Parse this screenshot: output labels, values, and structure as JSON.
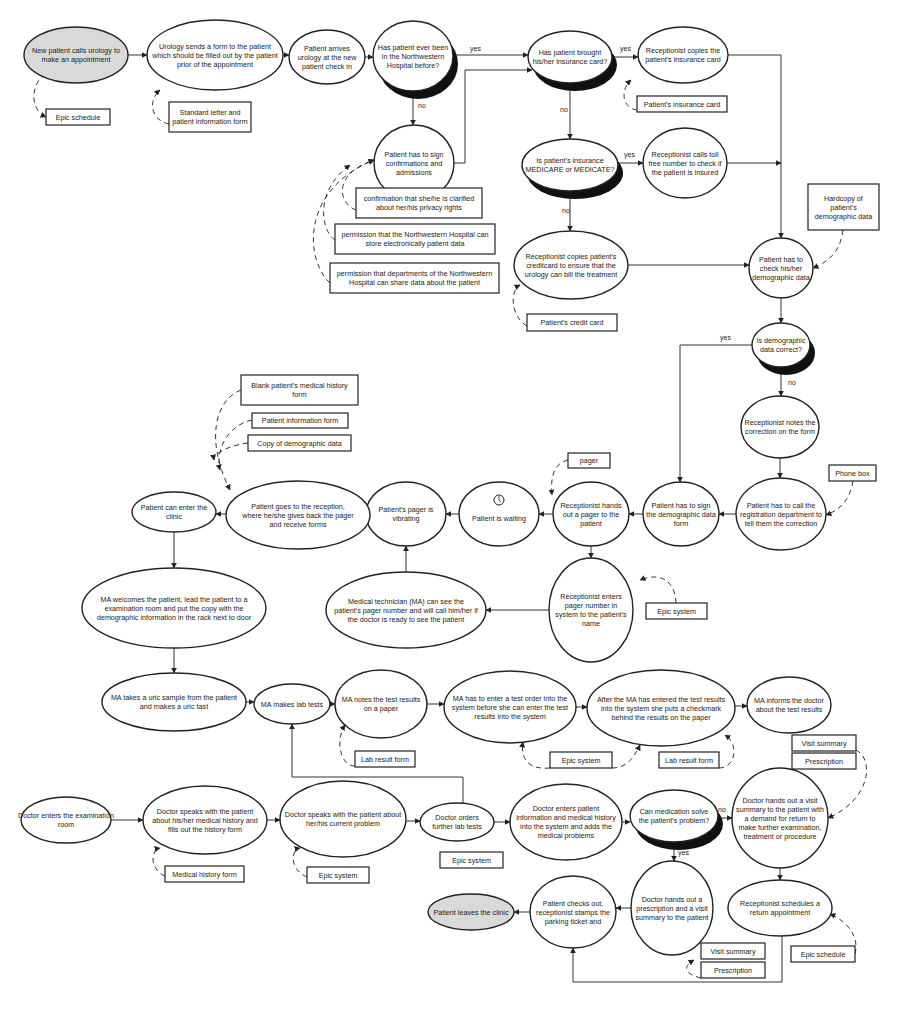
{
  "diagram": {
    "nodes": [
      {
        "id": "n1",
        "type": "start",
        "cx": 76,
        "cy": 55,
        "rx": 52,
        "ry": 28,
        "lines": [
          "New patient calls urology to",
          "make an appointment"
        ]
      },
      {
        "id": "n2",
        "type": "process",
        "cx": 215,
        "cy": 55,
        "rx": 68,
        "ry": 35,
        "lines": [
          "Urology sends a form to the patient",
          "which should be filled out by the patient",
          "prior of the appointment"
        ]
      },
      {
        "id": "n3",
        "type": "process",
        "cx": 327,
        "cy": 57,
        "rx": 38,
        "ry": 27,
        "lines": [
          "Patient arrives",
          "urology at the new",
          "patient check in"
        ]
      },
      {
        "id": "n4",
        "type": "decision",
        "cx": 413,
        "cy": 56,
        "rx": 40,
        "ry": 35,
        "lines": [
          "Has patient ever been",
          "in the Northwestern",
          "Hospital before?"
        ]
      },
      {
        "id": "n5",
        "type": "decision",
        "cx": 570,
        "cy": 57,
        "rx": 42,
        "ry": 26,
        "lines": [
          "Has patient brought",
          "his/her insurance card?"
        ]
      },
      {
        "id": "n6",
        "type": "process",
        "cx": 683,
        "cy": 55,
        "rx": 45,
        "ry": 28,
        "lines": [
          "Receptionist copies the",
          "patient's insurance card"
        ]
      },
      {
        "id": "n7",
        "type": "process",
        "cx": 414,
        "cy": 163,
        "rx": 40,
        "ry": 38,
        "lines": [
          "Patient has to sign",
          "confirmations and",
          "admissions"
        ]
      },
      {
        "id": "n8",
        "type": "decision",
        "cx": 570,
        "cy": 165,
        "rx": 48,
        "ry": 26,
        "lines": [
          "Is patient's insurance",
          "MEDICARE or MEDICATE?"
        ]
      },
      {
        "id": "n9",
        "type": "process",
        "cx": 685,
        "cy": 163,
        "rx": 42,
        "ry": 35,
        "lines": [
          "Receptionist calls toll",
          "free number to check if",
          "the patient is insured"
        ]
      },
      {
        "id": "n10",
        "type": "process",
        "cx": 571,
        "cy": 265,
        "rx": 57,
        "ry": 34,
        "lines": [
          "Receptionist copies patient's",
          "creditcard to ensure that the",
          "urology can bill the treatment"
        ]
      },
      {
        "id": "n11",
        "type": "process",
        "cx": 781,
        "cy": 268,
        "rx": 32,
        "ry": 30,
        "lines": [
          "Patient has to",
          "check his/her",
          "demographic data"
        ]
      },
      {
        "id": "n12",
        "type": "decision",
        "cx": 781,
        "cy": 345,
        "rx": 29,
        "ry": 22,
        "lines": [
          "Is demographic",
          "data correct?"
        ]
      },
      {
        "id": "n13",
        "type": "process",
        "cx": 780,
        "cy": 427,
        "rx": 39,
        "ry": 31,
        "lines": [
          "Receptionist notes the",
          "correction on the form"
        ]
      },
      {
        "id": "n14",
        "type": "process",
        "cx": 781,
        "cy": 514,
        "rx": 45,
        "ry": 36,
        "lines": [
          "Patient has to call the",
          "registration department to",
          "tell them the correction"
        ]
      },
      {
        "id": "n15",
        "type": "process",
        "cx": 681,
        "cy": 514,
        "rx": 38,
        "ry": 32,
        "lines": [
          "Patient has to sign",
          "the demographic data",
          "form"
        ]
      },
      {
        "id": "n16",
        "type": "process",
        "cx": 591,
        "cy": 514,
        "rx": 38,
        "ry": 32,
        "lines": [
          "Receptionist hands",
          "out a pager to the",
          "patient"
        ]
      },
      {
        "id": "n17",
        "type": "process",
        "cx": 499,
        "cy": 514,
        "rx": 40,
        "ry": 32,
        "lines": [
          "",
          "Patient is waiting"
        ],
        "icon": "clock-icon"
      },
      {
        "id": "n18",
        "type": "process",
        "cx": 406,
        "cy": 514,
        "rx": 40,
        "ry": 32,
        "lines": [
          "Patient's pager is",
          "vibrating"
        ]
      },
      {
        "id": "n19",
        "type": "process",
        "cx": 298,
        "cy": 515,
        "rx": 72,
        "ry": 34,
        "lines": [
          "Patient goes to the reception,",
          "where he/she gives back the pager",
          "and receive forms"
        ]
      },
      {
        "id": "n20",
        "type": "process",
        "cx": 174,
        "cy": 512,
        "rx": 42,
        "ry": 20,
        "lines": [
          "Patient can enter the",
          "clinic"
        ]
      },
      {
        "id": "n21",
        "type": "process",
        "cx": 174,
        "cy": 608,
        "rx": 92,
        "ry": 40,
        "lines": [
          "MA welcomes the patient, lead the patient to a",
          "examination room and put the copy with the",
          "demographic information in the rack next to door"
        ]
      },
      {
        "id": "n22",
        "type": "process",
        "cx": 406,
        "cy": 610,
        "rx": 80,
        "ry": 38,
        "lines": [
          "Medical technician (MA) can see the",
          "patient's pager number and will call him/her if",
          "the doctor is ready to see the patient"
        ]
      },
      {
        "id": "n23",
        "type": "process",
        "cx": 591,
        "cy": 610,
        "rx": 42,
        "ry": 52,
        "lines": [
          "Receptionist enters",
          "pager number in",
          "system to the patient's",
          "name"
        ]
      },
      {
        "id": "n24",
        "type": "process",
        "cx": 174,
        "cy": 702,
        "rx": 72,
        "ry": 29,
        "lines": [
          "MA takes a uric sample from the patient",
          "and makes a uric tast"
        ]
      },
      {
        "id": "n25",
        "type": "process",
        "cx": 292,
        "cy": 704,
        "rx": 38,
        "ry": 20,
        "lines": [
          "MA makes lab tests"
        ]
      },
      {
        "id": "n26",
        "type": "process",
        "cx": 381,
        "cy": 704,
        "rx": 46,
        "ry": 34,
        "lines": [
          "MA notes the test results",
          "on a paper"
        ]
      },
      {
        "id": "n27",
        "type": "process",
        "cx": 510,
        "cy": 707,
        "rx": 66,
        "ry": 36,
        "lines": [
          "MA has to enter a test order into the",
          "system before she can enter the test",
          "results into the system"
        ]
      },
      {
        "id": "n28",
        "type": "process",
        "cx": 661,
        "cy": 708,
        "rx": 74,
        "ry": 38,
        "lines": [
          "After the MA has entered the test results",
          "into the system she puts a checkmark",
          "behind the results on the paper"
        ]
      },
      {
        "id": "n29",
        "type": "process",
        "cx": 789,
        "cy": 705,
        "rx": 42,
        "ry": 28,
        "lines": [
          "MA informs the doctor",
          "about the test results"
        ]
      },
      {
        "id": "n30",
        "type": "process",
        "cx": 66,
        "cy": 820,
        "rx": 45,
        "ry": 23,
        "lines": [
          "Doctor enters the examination",
          "room"
        ]
      },
      {
        "id": "n31",
        "type": "process",
        "cx": 205,
        "cy": 820,
        "rx": 62,
        "ry": 34,
        "lines": [
          "Doctor speaks with the patient",
          "about his/her medical history and",
          "fills out the history form"
        ]
      },
      {
        "id": "n32",
        "type": "process",
        "cx": 343,
        "cy": 819,
        "rx": 63,
        "ry": 38,
        "lines": [
          "Doctor speaks with the patient about",
          "her/his current problem"
        ]
      },
      {
        "id": "n33",
        "type": "process",
        "cx": 457,
        "cy": 822,
        "rx": 37,
        "ry": 19,
        "lines": [
          "Doctor orders",
          "further lab tests"
        ]
      },
      {
        "id": "n34",
        "type": "process",
        "cx": 566,
        "cy": 822,
        "rx": 56,
        "ry": 38,
        "lines": [
          "Doctor enters patient",
          "information and medical history",
          "into the system and adds the",
          "medical problems"
        ]
      },
      {
        "id": "n35",
        "type": "decision",
        "cx": 674,
        "cy": 816,
        "rx": 44,
        "ry": 26,
        "lines": [
          "Can medication solve",
          "the patient's problem?"
        ]
      },
      {
        "id": "n36",
        "type": "process",
        "cx": 780,
        "cy": 818,
        "rx": 48,
        "ry": 50,
        "lines": [
          "Doctor hands out a visit",
          "summary to the patient with",
          "a demand for return to",
          "make further examination,",
          "treatment or procedure"
        ]
      },
      {
        "id": "n37",
        "type": "process",
        "cx": 780,
        "cy": 908,
        "rx": 52,
        "ry": 28,
        "lines": [
          "Receptionist schedules a",
          "return appointment"
        ]
      },
      {
        "id": "n38",
        "type": "process",
        "cx": 672,
        "cy": 908,
        "rx": 41,
        "ry": 47,
        "lines": [
          "Doctor hands out a",
          "prescription and a visit",
          "summary to the patient"
        ]
      },
      {
        "id": "n39",
        "type": "process",
        "cx": 573,
        "cy": 912,
        "rx": 43,
        "ry": 36,
        "lines": [
          "Patient checks out,",
          "receptionist stamps the",
          "parking ticket and"
        ]
      },
      {
        "id": "n40",
        "type": "end",
        "cx": 471,
        "cy": 912,
        "rx": 43,
        "ry": 18,
        "lines": [
          "Patient leaves the clinic"
        ]
      }
    ],
    "documents": [
      {
        "id": "d1",
        "x": 46,
        "y": 109,
        "w": 64,
        "h": 16,
        "lines": [
          "Epic schedule"
        ]
      },
      {
        "id": "d2",
        "x": 169,
        "y": 102,
        "w": 82,
        "h": 30,
        "lines": [
          "Standard letter and",
          "patient information form"
        ]
      },
      {
        "id": "d3",
        "x": 637,
        "y": 96,
        "w": 90,
        "h": 16,
        "lines": [
          "Patient's insurance card"
        ]
      },
      {
        "id": "d4",
        "x": 356,
        "y": 188,
        "w": 126,
        "h": 30,
        "lines": [
          "confirmation that she/he is clarified",
          "about her/his privacy rights"
        ]
      },
      {
        "id": "d5",
        "x": 335,
        "y": 224,
        "w": 160,
        "h": 30,
        "lines": [
          "permission that the Northwestern Hospital can",
          "store electronically patient data"
        ]
      },
      {
        "id": "d6",
        "x": 330,
        "y": 263,
        "w": 169,
        "h": 30,
        "lines": [
          "permission that departments of the Northwestern",
          "Hospital can share data about the patient"
        ]
      },
      {
        "id": "d7",
        "x": 527,
        "y": 314,
        "w": 90,
        "h": 17,
        "lines": [
          "Patient's credit card"
        ]
      },
      {
        "id": "d8",
        "x": 808,
        "y": 184,
        "w": 71,
        "h": 46,
        "lines": [
          "Hardcopy of",
          "patient's",
          "demographic data"
        ]
      },
      {
        "id": "d9",
        "x": 829,
        "y": 465,
        "w": 47,
        "h": 16,
        "lines": [
          "Phone box"
        ]
      },
      {
        "id": "d10",
        "x": 241,
        "y": 375,
        "w": 117,
        "h": 30,
        "lines": [
          "Blank patient's medical history",
          "form"
        ]
      },
      {
        "id": "d11",
        "x": 252,
        "y": 413,
        "w": 96,
        "h": 15,
        "lines": [
          "Patient information form"
        ]
      },
      {
        "id": "d12",
        "x": 248,
        "y": 435,
        "w": 103,
        "h": 16,
        "lines": [
          "Copy of demographic data"
        ]
      },
      {
        "id": "d13",
        "x": 568,
        "y": 453,
        "w": 42,
        "h": 15,
        "lines": [
          "pager"
        ]
      },
      {
        "id": "d14",
        "x": 646,
        "y": 603,
        "w": 61,
        "h": 16,
        "lines": [
          "Epic system"
        ]
      },
      {
        "id": "d15",
        "x": 355,
        "y": 751,
        "w": 60,
        "h": 16,
        "lines": [
          "Lab result form"
        ]
      },
      {
        "id": "d16",
        "x": 550,
        "y": 752,
        "w": 62,
        "h": 16,
        "lines": [
          "Epic system"
        ]
      },
      {
        "id": "d17",
        "x": 659,
        "y": 752,
        "w": 60,
        "h": 16,
        "lines": [
          "Lab result form"
        ]
      },
      {
        "id": "d18",
        "x": 792,
        "y": 735,
        "w": 64,
        "h": 16,
        "lines": [
          "Visit summary"
        ]
      },
      {
        "id": "d19",
        "x": 792,
        "y": 753,
        "w": 64,
        "h": 16,
        "lines": [
          "Prescription"
        ]
      },
      {
        "id": "d20",
        "x": 165,
        "y": 866,
        "w": 79,
        "h": 16,
        "lines": [
          "Medical history form"
        ]
      },
      {
        "id": "d21",
        "x": 307,
        "y": 867,
        "w": 62,
        "h": 16,
        "lines": [
          "Epic system"
        ]
      },
      {
        "id": "d22",
        "x": 440,
        "y": 852,
        "w": 63,
        "h": 16,
        "lines": [
          "Epic system"
        ]
      },
      {
        "id": "d23",
        "x": 701,
        "y": 943,
        "w": 64,
        "h": 16,
        "lines": [
          "Visit summary"
        ]
      },
      {
        "id": "d24",
        "x": 701,
        "y": 962,
        "w": 64,
        "h": 16,
        "lines": [
          "Prescription"
        ]
      },
      {
        "id": "d25",
        "x": 791,
        "y": 946,
        "w": 64,
        "h": 16,
        "lines": [
          "Epic schedule"
        ]
      }
    ],
    "edges": [
      {
        "d": "M128,55 L147,55"
      },
      {
        "d": "M283,55 L289,55"
      },
      {
        "d": "M365,57 L373,57"
      },
      {
        "d": "M453,55 L528,55",
        "label": "yes",
        "lx": 470,
        "ly": 51
      },
      {
        "d": "M454,163 L465,163 L465,70 L532,70"
      },
      {
        "d": "M413,91 L413,125",
        "label": "no",
        "lx": 418,
        "ly": 108
      },
      {
        "d": "M612,57 L638,57",
        "label": "yes",
        "lx": 620,
        "ly": 51
      },
      {
        "d": "M570,83 L570,139",
        "label": "no",
        "lx": 560,
        "ly": 112
      },
      {
        "d": "M618,163 L643,163",
        "label": "yes",
        "lx": 624,
        "ly": 157
      },
      {
        "d": "M570,191 L570,231",
        "label": "no",
        "lx": 562,
        "ly": 213
      },
      {
        "d": "M728,55 L781,55 L781,238"
      },
      {
        "d": "M727,163 L781,163"
      },
      {
        "d": "M628,265 L749,265"
      },
      {
        "d": "M781,298 L781,323"
      },
      {
        "d": "M781,367 L781,396",
        "label": "no",
        "lx": 788,
        "ly": 385
      },
      {
        "d": "M752,345 L680,345 L680,482",
        "label": "yes",
        "lx": 720,
        "ly": 340
      },
      {
        "d": "M780,458 L780,478"
      },
      {
        "d": "M736,514 L719,514"
      },
      {
        "d": "M643,514 L629,514"
      },
      {
        "d": "M553,514 L539,514"
      },
      {
        "d": "M459,514 L446,514"
      },
      {
        "d": "M366,514 L370,514"
      },
      {
        "d": "M226,514 L216,514"
      },
      {
        "d": "M174,532 L174,568"
      },
      {
        "d": "M591,546 L591,558"
      },
      {
        "d": "M549,610 L486,610"
      },
      {
        "d": "M406,572 L406,546"
      },
      {
        "d": "M174,648 L174,673"
      },
      {
        "d": "M246,702 L254,702"
      },
      {
        "d": "M330,704 L335,704"
      },
      {
        "d": "M427,704 L444,704"
      },
      {
        "d": "M576,707 L587,707"
      },
      {
        "d": "M735,706 L747,706"
      },
      {
        "d": "M111,820 L143,820"
      },
      {
        "d": "M267,820 L280,820"
      },
      {
        "d": "M406,821 L420,821"
      },
      {
        "d": "M494,822 L510,822"
      },
      {
        "d": "M622,822 L630,822"
      },
      {
        "d": "M718,818 L732,818",
        "label": "no",
        "lx": 718,
        "ly": 812
      },
      {
        "d": "M674,842 L674,861",
        "label": "yes",
        "lx": 678,
        "ly": 855
      },
      {
        "d": "M780,868 L780,880"
      },
      {
        "d": "M631,908 L616,908"
      },
      {
        "d": "M530,912 L514,912"
      },
      {
        "d": "M463,803 L463,777 L292,777 L292,724"
      },
      {
        "d": "M782,936 L782,982 L573,982 L573,948"
      }
    ],
    "data_links": [
      {
        "d": "M45,74 C30,85 30,110 46,117"
      },
      {
        "d": "M169,124 C150,120 148,100 160,90"
      },
      {
        "d": "M637,110 C622,108 620,90 631,80"
      },
      {
        "d": "M356,210 C340,205 330,175 374,160"
      },
      {
        "d": "M335,240 C320,230 315,190 350,165"
      },
      {
        "d": "M330,283 C305,260 300,190 374,160"
      },
      {
        "d": "M527,326 C510,316 510,290 520,285"
      },
      {
        "d": "M843,230 C840,255 825,263 813,268"
      },
      {
        "d": "M853,481 C850,500 840,510 826,515"
      },
      {
        "d": "M241,390 C215,400 205,440 230,490"
      },
      {
        "d": "M252,420 C228,425 215,450 220,470"
      },
      {
        "d": "M248,443 C225,446 213,455 214,460"
      },
      {
        "d": "M568,460 C555,463 550,475 552,495"
      },
      {
        "d": "M676,603 C675,580 660,572 640,580"
      },
      {
        "d": "M355,766 C340,766 335,740 345,725"
      },
      {
        "d": "M550,768 C530,770 520,760 523,742"
      },
      {
        "d": "M612,768 C625,768 633,760 640,745"
      },
      {
        "d": "M719,768 C735,768 740,745 725,735"
      },
      {
        "d": "M856,750 C875,760 870,800 828,818"
      },
      {
        "d": "M165,876 C150,870 150,850 160,848"
      },
      {
        "d": "M307,877 C290,870 290,850 300,848"
      },
      {
        "d": "M701,978 C688,975 680,968 694,960"
      },
      {
        "d": "M855,954 C860,935 845,920 830,914"
      }
    ]
  }
}
